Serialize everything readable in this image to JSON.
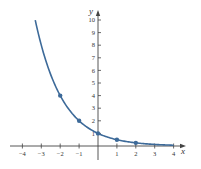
{
  "chart_data": {
    "type": "line",
    "title": "",
    "function": "y = (1/2)^x",
    "xlabel": "x",
    "ylabel": "y",
    "xlim": [
      -4.3,
      4.5
    ],
    "ylim": [
      0,
      10.5
    ],
    "x_ticks": [
      -4,
      -3,
      -2,
      -1,
      0,
      1,
      2,
      3,
      4
    ],
    "x_tick_labels": [
      "−4",
      "−3",
      "−2",
      "−1",
      "",
      "1",
      "2",
      "3",
      "4"
    ],
    "y_ticks": [
      1,
      2,
      3,
      4,
      5,
      6,
      7,
      8,
      9,
      10
    ],
    "y_tick_labels": [
      "1",
      "2",
      "3",
      "4",
      "5",
      "6",
      "7",
      "8",
      "9",
      "10"
    ],
    "grid": false,
    "legend": null,
    "series": [
      {
        "name": "(1/2)^x",
        "color": "#3d6a99",
        "curve_x_range": [
          -3.32,
          4
        ],
        "points": [
          {
            "x": -2,
            "y": 4
          },
          {
            "x": -1,
            "y": 2
          },
          {
            "x": 0,
            "y": 1
          },
          {
            "x": 1,
            "y": 0.5
          },
          {
            "x": 2,
            "y": 0.25
          }
        ]
      }
    ]
  },
  "colors": {
    "curve": "#3d6a99",
    "axis": "#444444",
    "text": "#333333"
  }
}
